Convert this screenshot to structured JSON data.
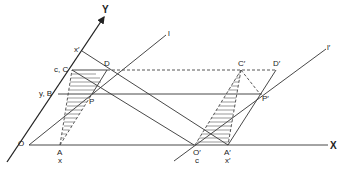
{
  "figure": {
    "type": "geometric construction diagram",
    "axes": {
      "x_label": "X",
      "y_label": "Y"
    },
    "lines": {
      "l_label": "l",
      "l_prime_label": "l′"
    },
    "points": {
      "O": "O",
      "A": "A",
      "x_under_A": "x",
      "B": "y, B",
      "C": "c, C",
      "D": "D",
      "P": "P",
      "x_prime": "x′",
      "O_prime": "O′",
      "c_under_O_prime": "c",
      "A_prime": "A′",
      "x_prime_under_A_prime": "x′",
      "C_prime": "C′",
      "D_prime": "D′",
      "P_prime": "P′"
    }
  }
}
